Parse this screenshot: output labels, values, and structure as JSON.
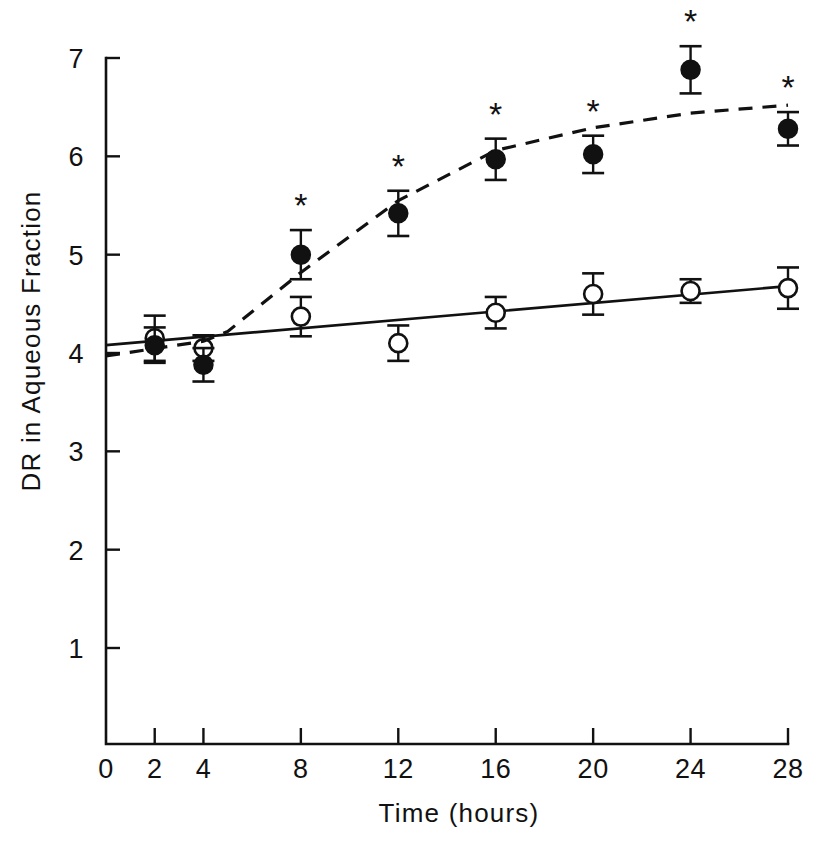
{
  "chart_data": {
    "type": "line",
    "title": "",
    "subtitle": "",
    "xlabel": "Time (hours)",
    "ylabel": "DR in Aqueous Fraction",
    "xlim": [
      0,
      28
    ],
    "ylim": [
      0,
      7.25
    ],
    "grid": false,
    "legend": "none",
    "x_ticks": [
      0,
      2,
      4,
      8,
      12,
      16,
      20,
      24,
      28
    ],
    "x_tick_labels": [
      "0",
      "2",
      "4",
      "8",
      "12",
      "16",
      "20",
      "24",
      "28"
    ],
    "y_ticks": [
      1,
      2,
      3,
      4,
      5,
      6,
      7
    ],
    "y_tick_labels": [
      "1",
      "2",
      "3",
      "4",
      "5",
      "6",
      "7"
    ],
    "annotation_symbol": "*",
    "annotation_meaning": "significant vs control",
    "series": [
      {
        "name": "open-circle-series",
        "marker": "open-circle",
        "line_style": "solid",
        "x": [
          2,
          4,
          8,
          12,
          16,
          20,
          24,
          28
        ],
        "values": [
          4.15,
          4.05,
          4.37,
          4.1,
          4.41,
          4.6,
          4.63,
          4.66
        ],
        "errors": [
          0.23,
          0.13,
          0.2,
          0.18,
          0.16,
          0.21,
          0.12,
          0.21
        ],
        "significant": [
          false,
          false,
          false,
          false,
          false,
          false,
          false,
          false
        ],
        "fit_line": {
          "x0": 0,
          "y0": 4.08,
          "x1": 28,
          "y1": 4.68
        }
      },
      {
        "name": "filled-circle-series",
        "marker": "filled-circle",
        "line_style": "dashed",
        "x": [
          2,
          4,
          8,
          12,
          16,
          20,
          24,
          28
        ],
        "values": [
          4.08,
          3.88,
          5.0,
          5.42,
          5.97,
          6.02,
          6.88,
          6.28
        ],
        "errors": [
          0.18,
          0.17,
          0.25,
          0.23,
          0.21,
          0.19,
          0.24,
          0.17
        ],
        "significant": [
          false,
          false,
          true,
          true,
          true,
          true,
          true,
          true
        ],
        "trend_points": [
          {
            "x": 0,
            "y": 3.97
          },
          {
            "x": 4,
            "y": 4.12
          },
          {
            "x": 5,
            "y": 4.22
          },
          {
            "x": 8,
            "y": 4.82
          },
          {
            "x": 12,
            "y": 5.55
          },
          {
            "x": 16,
            "y": 6.06
          },
          {
            "x": 20,
            "y": 6.29
          },
          {
            "x": 24,
            "y": 6.44
          },
          {
            "x": 28,
            "y": 6.52
          }
        ]
      }
    ]
  },
  "figure": {
    "background_color": "#ffffff",
    "ink_color": "#111111"
  }
}
